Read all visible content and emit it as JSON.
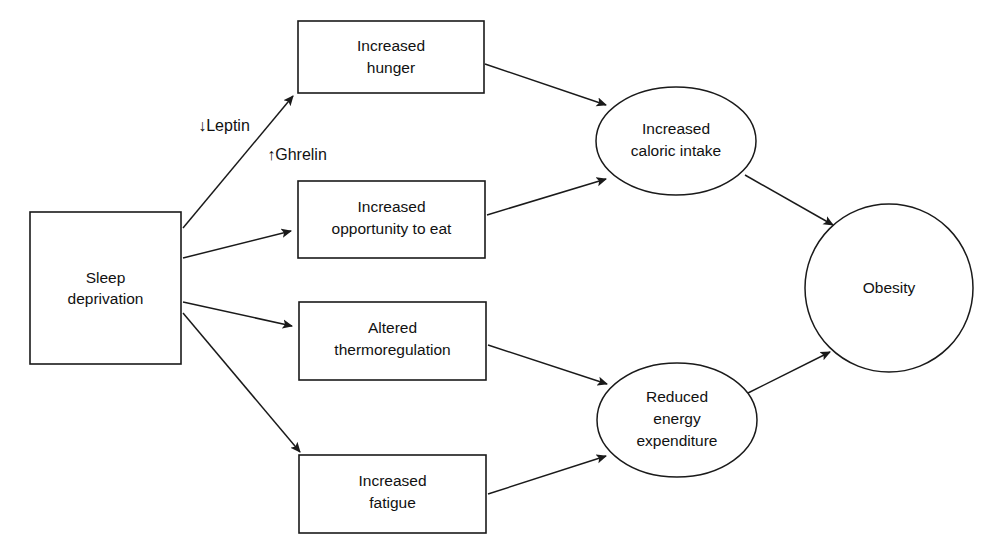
{
  "diagram": {
    "background_color": "#ffffff",
    "line_color": "#1a1a1a",
    "text_color": "#111111",
    "nodes": [
      {
        "id": "sleep-deprivation",
        "shape": "rectangle",
        "lines": [
          "Sleep",
          "deprivation"
        ],
        "x": 30,
        "y": 212,
        "width": 151,
        "height": 152
      },
      {
        "id": "increased-hunger",
        "shape": "rectangle",
        "lines": [
          "Increased",
          "hunger"
        ],
        "x": 298,
        "y": 21,
        "width": 186,
        "height": 72
      },
      {
        "id": "increased-opportunity-to-eat",
        "shape": "rectangle",
        "lines": [
          "Increased",
          "opportunity to eat"
        ],
        "x": 298,
        "y": 181,
        "width": 187,
        "height": 77
      },
      {
        "id": "altered-thermoregulation",
        "shape": "rectangle",
        "lines": [
          "Altered",
          "thermoregulation"
        ],
        "x": 299,
        "y": 302,
        "width": 187,
        "height": 78
      },
      {
        "id": "increased-fatigue",
        "shape": "rectangle",
        "lines": [
          "Increased",
          "fatigue"
        ],
        "x": 299,
        "y": 455,
        "width": 187,
        "height": 78
      },
      {
        "id": "increased-caloric-intake",
        "shape": "ellipse",
        "lines": [
          "Increased",
          "caloric intake"
        ],
        "cx": 676,
        "cy": 141,
        "rx": 80,
        "ry": 54
      },
      {
        "id": "reduced-energy-expenditure",
        "shape": "ellipse",
        "lines": [
          "Reduced",
          "energy",
          "expenditure"
        ],
        "cx": 677,
        "cy": 420,
        "rx": 80,
        "ry": 57
      },
      {
        "id": "obesity",
        "shape": "circle",
        "lines": [
          "Obesity"
        ],
        "cx": 889,
        "cy": 288,
        "r": 84
      }
    ],
    "edges": [
      {
        "id": "sleep-to-hunger",
        "from": "sleep-deprivation",
        "to": "increased-hunger"
      },
      {
        "id": "sleep-to-opportunity",
        "from": "sleep-deprivation",
        "to": "increased-opportunity-to-eat"
      },
      {
        "id": "sleep-to-thermoregulation",
        "from": "sleep-deprivation",
        "to": "altered-thermoregulation"
      },
      {
        "id": "sleep-to-fatigue",
        "from": "sleep-deprivation",
        "to": "increased-fatigue"
      },
      {
        "id": "hunger-to-caloric-intake",
        "from": "increased-hunger",
        "to": "increased-caloric-intake"
      },
      {
        "id": "opportunity-to-caloric-intake",
        "from": "increased-opportunity-to-eat",
        "to": "increased-caloric-intake"
      },
      {
        "id": "thermoregulation-to-energy-expenditure",
        "from": "altered-thermoregulation",
        "to": "reduced-energy-expenditure"
      },
      {
        "id": "fatigue-to-energy-expenditure",
        "from": "increased-fatigue",
        "to": "reduced-energy-expenditure"
      },
      {
        "id": "caloric-intake-to-obesity",
        "from": "increased-caloric-intake",
        "to": "obesity"
      },
      {
        "id": "energy-expenditure-to-obesity",
        "from": "reduced-energy-expenditure",
        "to": "obesity"
      }
    ],
    "edge_labels": [
      {
        "id": "leptin-label",
        "text": "↓Leptin",
        "x": 224,
        "y": 127
      },
      {
        "id": "ghrelin-label",
        "text": "↑Ghrelin",
        "x": 297,
        "y": 156
      }
    ]
  }
}
